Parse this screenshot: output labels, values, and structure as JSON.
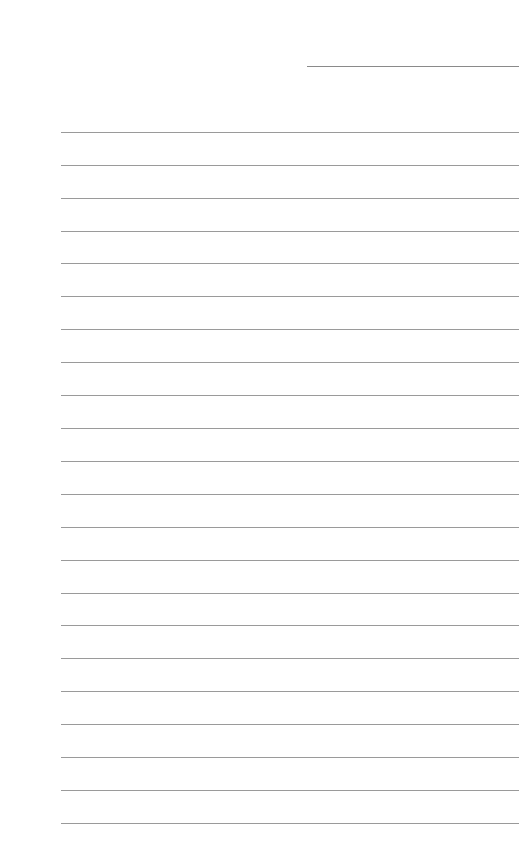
{
  "page": {
    "type": "lined-paper",
    "background": "#ffffff",
    "line_color": "#9a9a9a",
    "header_line": {
      "x": 307,
      "y": 66,
      "width": 212
    },
    "rules": {
      "left": 61,
      "width": 458,
      "y_positions": [
        132,
        165,
        198,
        231,
        263,
        296,
        329,
        362,
        395,
        428,
        461,
        494,
        527,
        560,
        593,
        625,
        658,
        691,
        724,
        757,
        790,
        823
      ]
    }
  }
}
